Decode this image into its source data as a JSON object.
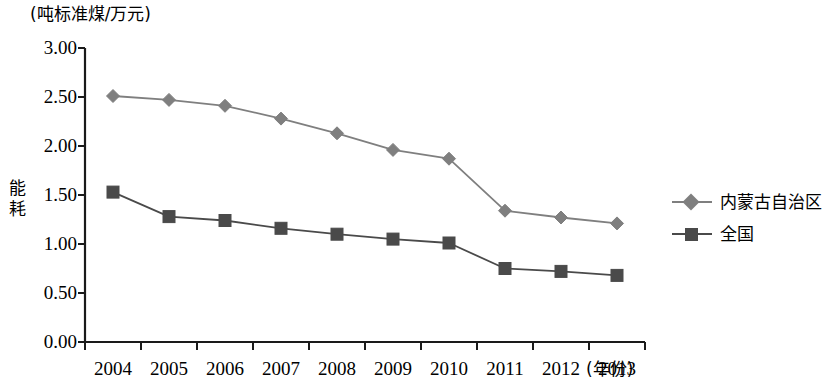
{
  "chart_data": {
    "type": "line",
    "title": "",
    "unit_label": "(吨标准煤/万元)",
    "ylabel": "能耗",
    "xlabel": "(年份)",
    "categories": [
      "2004",
      "2005",
      "2006",
      "2007",
      "2008",
      "2009",
      "2010",
      "2011",
      "2012",
      "2013"
    ],
    "ylim": [
      0.0,
      3.0
    ],
    "ytick_values": [
      0.0,
      0.5,
      1.0,
      1.5,
      2.0,
      2.5,
      3.0
    ],
    "ytick_labels": [
      "0.00",
      "0.50",
      "1.00",
      "1.50",
      "2.00",
      "2.50",
      "3.00"
    ],
    "grid": false,
    "legend_position": "right",
    "series": [
      {
        "name": "内蒙古自治区",
        "marker": "diamond",
        "color": "#7f7f7f",
        "values": [
          2.51,
          2.47,
          2.41,
          2.28,
          2.13,
          1.96,
          1.87,
          1.34,
          1.27,
          1.21
        ]
      },
      {
        "name": "全国",
        "marker": "square",
        "color": "#4a4a4a",
        "values": [
          1.53,
          1.28,
          1.24,
          1.16,
          1.1,
          1.05,
          1.01,
          0.75,
          0.72,
          0.68
        ]
      }
    ]
  }
}
